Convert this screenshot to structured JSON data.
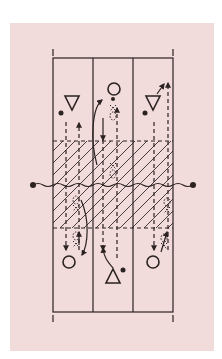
{
  "diagram": {
    "type": "court-rotation-diagram",
    "colors": {
      "background": "#ffffff",
      "panel": "#f2dcdb",
      "ink": "#2b2222",
      "hatch": "#2b2222"
    },
    "court": {
      "lanes": 3,
      "zone": "hatched-front-zone",
      "net": "wavy-net-with-posts"
    },
    "players": [
      {
        "id": "top-left",
        "shape": "triangle-down",
        "side": "top",
        "lane": 1,
        "with_ball": true
      },
      {
        "id": "top-center",
        "shape": "circle",
        "side": "top",
        "lane": 2,
        "with_ball": true
      },
      {
        "id": "top-right",
        "shape": "triangle-down",
        "side": "top",
        "lane": 3,
        "with_ball": true
      },
      {
        "id": "bottom-left",
        "shape": "circle",
        "side": "bottom",
        "lane": 1,
        "with_ball": false
      },
      {
        "id": "bottom-center",
        "shape": "triangle-up",
        "side": "bottom",
        "lane": 2,
        "with_ball": true
      },
      {
        "id": "bottom-right",
        "shape": "circle",
        "side": "bottom",
        "lane": 3,
        "with_ball": false
      }
    ],
    "legend": []
  }
}
